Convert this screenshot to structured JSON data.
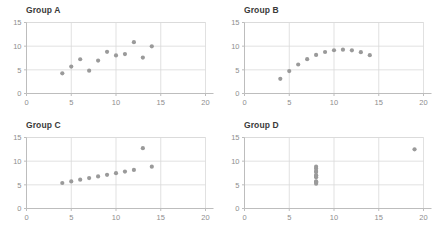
{
  "figure": {
    "background": "#ffffff",
    "dot_color": "#9a9a9a",
    "grid_color": "#d9d9d9",
    "axis_color": "#bdbdbd",
    "tick_label_color": "#8e8e8e",
    "title_color": "#3a3a3a"
  },
  "chart_data": [
    {
      "type": "scatter",
      "title": "Group A",
      "xlabel": "",
      "ylabel": "",
      "xlim": [
        0,
        20
      ],
      "ylim": [
        0,
        15
      ],
      "xticks": [
        0,
        5,
        10,
        15,
        20
      ],
      "yticks": [
        0,
        5,
        10,
        15
      ],
      "grid": true,
      "legend": "none",
      "x": [
        10,
        8,
        13,
        9,
        11,
        14,
        6,
        4,
        12,
        7,
        5
      ],
      "y": [
        8.04,
        6.95,
        7.58,
        8.81,
        8.33,
        9.96,
        7.24,
        4.26,
        10.84,
        4.82,
        5.68
      ]
    },
    {
      "type": "scatter",
      "title": "Group B",
      "xlabel": "",
      "ylabel": "",
      "xlim": [
        0,
        20
      ],
      "ylim": [
        0,
        15
      ],
      "xticks": [
        0,
        5,
        10,
        15,
        20
      ],
      "yticks": [
        0,
        5,
        10,
        15
      ],
      "grid": true,
      "legend": "none",
      "x": [
        10,
        8,
        13,
        9,
        11,
        14,
        6,
        4,
        12,
        7,
        5
      ],
      "y": [
        9.14,
        8.14,
        8.74,
        8.77,
        9.26,
        8.1,
        6.13,
        3.1,
        9.13,
        7.26,
        4.74
      ]
    },
    {
      "type": "scatter",
      "title": "Group C",
      "xlabel": "",
      "ylabel": "",
      "xlim": [
        0,
        20
      ],
      "ylim": [
        0,
        15
      ],
      "xticks": [
        0,
        5,
        10,
        15,
        20
      ],
      "yticks": [
        0,
        5,
        10,
        15
      ],
      "grid": true,
      "legend": "none",
      "x": [
        10,
        8,
        13,
        9,
        11,
        14,
        6,
        4,
        12,
        7,
        5
      ],
      "y": [
        7.46,
        6.77,
        12.74,
        7.11,
        7.81,
        8.84,
        6.08,
        5.39,
        8.15,
        6.42,
        5.73
      ]
    },
    {
      "type": "scatter",
      "title": "Group D",
      "xlabel": "",
      "ylabel": "",
      "xlim": [
        0,
        20
      ],
      "ylim": [
        0,
        15
      ],
      "xticks": [
        0,
        5,
        10,
        15,
        20
      ],
      "yticks": [
        0,
        5,
        10,
        15
      ],
      "grid": true,
      "legend": "none",
      "x": [
        8,
        8,
        8,
        8,
        8,
        8,
        8,
        19,
        8,
        8,
        8
      ],
      "y": [
        6.58,
        5.76,
        7.71,
        8.84,
        8.47,
        7.04,
        5.25,
        12.5,
        5.56,
        7.91,
        6.89
      ]
    }
  ]
}
